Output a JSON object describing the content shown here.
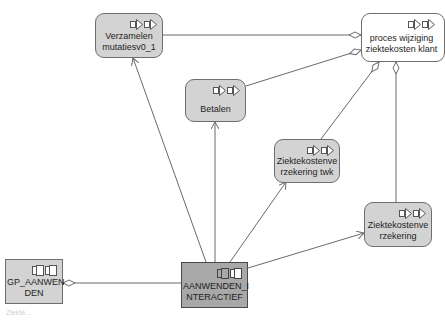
{
  "diagram": {
    "nodes": [
      {
        "id": "verzamelen",
        "label": "Verzamelen\nmutatiesv0_1",
        "shape": "rounded",
        "fill": "#d3d3d3",
        "icon": "process-step-icon"
      },
      {
        "id": "proces",
        "label": "proces wijziging\nziektekosten klant",
        "shape": "rounded",
        "fill": "#ffffff",
        "icon": "process-step-icon"
      },
      {
        "id": "betalen",
        "label": "Betalen",
        "shape": "rounded",
        "fill": "#d3d3d3",
        "icon": "process-step-icon"
      },
      {
        "id": "zkv_twk",
        "label": "Ziektekostenve\nrzekering twk",
        "shape": "rounded",
        "fill": "#d3d3d3",
        "icon": "process-step-icon"
      },
      {
        "id": "zkv",
        "label": "Ziektekostenve\nrzekering",
        "shape": "rounded",
        "fill": "#d3d3d3",
        "icon": "process-step-icon"
      },
      {
        "id": "gp_aanwenden",
        "label": "GP_AANWEN\nDEN",
        "shape": "rect",
        "fill": "#d3d3d3",
        "icon": "component-icon"
      },
      {
        "id": "aanwenden_interactief",
        "label": "AANWENDEN_I\nNTERACTIEF",
        "shape": "rect",
        "fill": "#a8a8a8",
        "icon": "component-icon"
      }
    ],
    "edges": [
      {
        "from": "verzamelen",
        "to": "proces",
        "type": "aggregation"
      },
      {
        "from": "betalen",
        "to": "proces",
        "type": "aggregation"
      },
      {
        "from": "zkv_twk",
        "to": "proces",
        "type": "aggregation"
      },
      {
        "from": "zkv",
        "to": "proces",
        "type": "aggregation"
      },
      {
        "from": "aanwenden_interactief",
        "to": "verzamelen",
        "type": "association-arrow"
      },
      {
        "from": "aanwenden_interactief",
        "to": "betalen",
        "type": "association-arrow"
      },
      {
        "from": "aanwenden_interactief",
        "to": "zkv_twk",
        "type": "association-arrow"
      },
      {
        "from": "aanwenden_interactief",
        "to": "zkv",
        "type": "association-arrow"
      },
      {
        "from": "aanwenden_interactief",
        "to": "gp_aanwenden",
        "type": "aggregation"
      }
    ],
    "colors": {
      "line": "#6a6a6a",
      "border": "#6e6e6e",
      "node_fill": "#d3d3d3",
      "selected_fill": "#a8a8a8"
    }
  },
  "footer": {
    "text": "Ziekte..."
  }
}
